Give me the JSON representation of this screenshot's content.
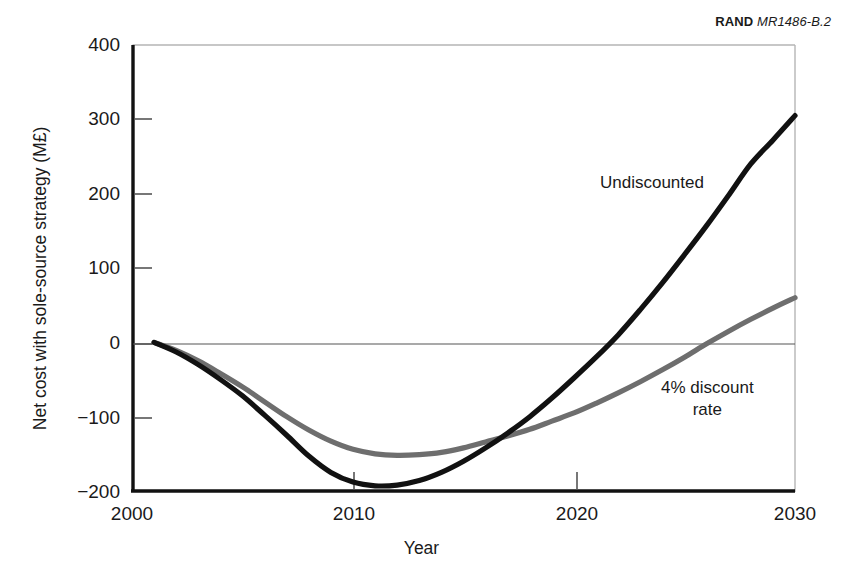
{
  "figure": {
    "source_note": {
      "brand": "RAND",
      "doc_id": "MR1486-B.2"
    }
  },
  "chart_data": {
    "type": "line",
    "title": "",
    "xlabel": "Year",
    "ylabel": "Net cost with sole-source strategy (M£)",
    "xlim": [
      2000,
      2030
    ],
    "ylim": [
      -200,
      400
    ],
    "xticks": [
      2000,
      2010,
      2020,
      2030
    ],
    "xtick_labels": [
      "2000",
      "2010",
      "2020",
      "2030"
    ],
    "yticks": [
      400,
      300,
      200,
      100,
      0,
      -100,
      -200
    ],
    "ytick_labels": [
      "400",
      "300",
      "200",
      "100",
      "0",
      "−100",
      "−200"
    ],
    "grid": false,
    "zero_line": true,
    "legend_position": "inline-annotations",
    "series": [
      {
        "name": "Undiscounted",
        "color": "#111111",
        "label_position": {
          "x": 2021,
          "y": 215
        },
        "x": [
          2001,
          2002,
          2003,
          2004,
          2005,
          2006,
          2007,
          2008,
          2009,
          2010,
          2011,
          2012,
          2013,
          2014,
          2015,
          2016,
          2017,
          2018,
          2019,
          2020,
          2021,
          2022,
          2023,
          2024,
          2025,
          2026,
          2027,
          2028,
          2029,
          2030
        ],
        "values": [
          0,
          -13,
          -30,
          -50,
          -72,
          -98,
          -125,
          -153,
          -175,
          -188,
          -193,
          -192,
          -186,
          -175,
          -160,
          -142,
          -122,
          -100,
          -75,
          -48,
          -20,
          10,
          44,
          80,
          118,
          157,
          198,
          240,
          272,
          305
        ]
      },
      {
        "name": "4% discount\nrate",
        "color": "#6e6e6e",
        "label_position": {
          "x": 2024,
          "y": -95
        },
        "x": [
          2001,
          2002,
          2003,
          2004,
          2005,
          2006,
          2007,
          2008,
          2009,
          2010,
          2011,
          2012,
          2013,
          2014,
          2015,
          2016,
          2017,
          2018,
          2019,
          2020,
          2021,
          2022,
          2023,
          2024,
          2025,
          2026,
          2027,
          2028,
          2029,
          2030
        ],
        "values": [
          0,
          -11,
          -25,
          -42,
          -60,
          -80,
          -100,
          -118,
          -133,
          -144,
          -150,
          -152,
          -151,
          -148,
          -142,
          -134,
          -126,
          -117,
          -106,
          -95,
          -82,
          -68,
          -53,
          -37,
          -20,
          -2,
          15,
          31,
          46,
          60
        ]
      }
    ],
    "annotations": [
      {
        "text": "Undiscounted",
        "x": 2021,
        "y": 215
      },
      {
        "text": "4% discount\nrate",
        "x": 2024,
        "y": -95
      }
    ]
  }
}
